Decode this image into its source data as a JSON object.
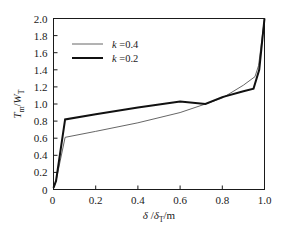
{
  "figure": {
    "background_color": "#ffffff",
    "frame_color": "#1a1a1a"
  },
  "chart_data": {
    "type": "line",
    "title": "",
    "subtitle": "",
    "xlabel": "δ /δₜ/m",
    "ylabel": "Tₘ/Wₜ",
    "xlabel_parts": {
      "sym1": "δ",
      "slash1": "/",
      "sym2": "δ",
      "sub2": "T",
      "slash2": "/m"
    },
    "ylabel_parts": {
      "sym1": "T",
      "sub1": "m",
      "slash1": "/",
      "sym2": "W",
      "sub2": "T"
    },
    "xlim": [
      0,
      1.0
    ],
    "ylim": [
      0,
      2.0
    ],
    "xticks": [
      0,
      0.2,
      0.4,
      0.6,
      0.8,
      1.0
    ],
    "xtick_labels": [
      "0",
      "0.2",
      "0.4",
      "0.6",
      "0.8",
      "1.0"
    ],
    "yticks": [
      0,
      0.2,
      0.4,
      0.6,
      0.8,
      1.0,
      1.2,
      1.4,
      1.6,
      1.8,
      2.0
    ],
    "ytick_labels": [
      "0",
      "0.2",
      "0.4",
      "0.6",
      "0.8",
      "1.0",
      "1.2",
      "1.4",
      "1.6",
      "1.8",
      "2.0"
    ],
    "grid": false,
    "legend_position": "upper-left-inside",
    "series": [
      {
        "name": "k =0.4",
        "label_sym": "k",
        "label_val": " =0.4",
        "color": "#555555",
        "line_width": 0.9,
        "x": [
          0.0,
          0.012,
          0.055,
          0.2,
          0.4,
          0.6,
          0.72,
          0.8,
          0.9,
          0.955,
          0.972,
          1.0
        ],
        "y": [
          0.02,
          0.1,
          0.61,
          0.68,
          0.78,
          0.9,
          1.0,
          1.07,
          1.22,
          1.32,
          1.45,
          2.0
        ]
      },
      {
        "name": "k =0.2",
        "label_sym": "k",
        "label_val": " =0.2",
        "color": "#111111",
        "line_width": 2.0,
        "x": [
          0.0,
          0.012,
          0.055,
          0.2,
          0.4,
          0.6,
          0.72,
          0.8,
          0.9,
          0.948,
          0.975,
          1.0
        ],
        "y": [
          0.02,
          0.1,
          0.82,
          0.88,
          0.96,
          1.03,
          1.0,
          1.08,
          1.15,
          1.18,
          1.4,
          2.0
        ]
      }
    ]
  },
  "legend": {
    "entries": [
      {
        "label_sym": "k",
        "label_val": " =0.4",
        "weight": "thin"
      },
      {
        "label_sym": "k",
        "label_val": " =0.2",
        "weight": "thick"
      }
    ]
  }
}
